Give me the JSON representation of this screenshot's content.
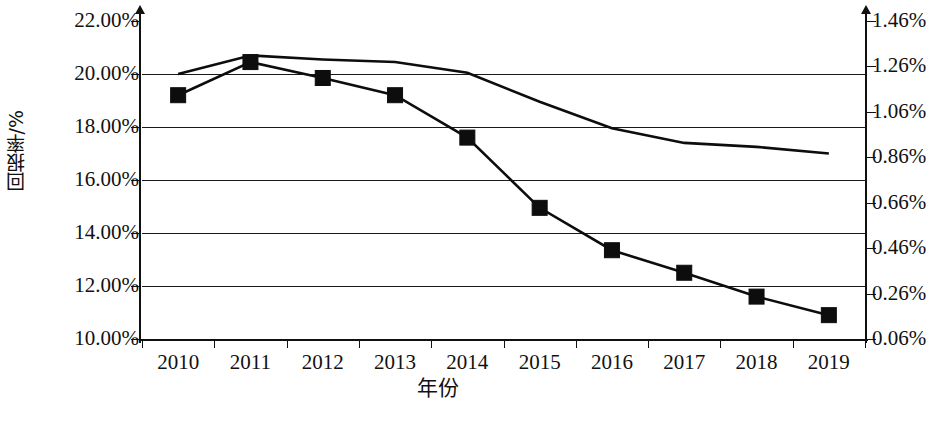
{
  "chart_data": {
    "type": "line",
    "title": "",
    "xlabel": "年份",
    "ylabel": "回报率/%",
    "ylabel_right": "",
    "categories": [
      "2010",
      "2011",
      "2012",
      "2013",
      "2014",
      "2015",
      "2016",
      "2017",
      "2018",
      "2019"
    ],
    "ylim": [
      10.0,
      22.0
    ],
    "yticks": [
      "10.00%",
      "12.00%",
      "14.00%",
      "16.00%",
      "18.00%",
      "20.00%",
      "22.00%"
    ],
    "ylim_right": [
      0.06,
      1.46
    ],
    "yticks_right": [
      "0.06%",
      "0.26%",
      "0.46%",
      "0.66%",
      "0.86%",
      "1.06%",
      "1.26%",
      "1.46%"
    ],
    "grid": true,
    "legend_position": "bottom",
    "series": [
      {
        "name": "ROE",
        "marker": "square",
        "axis": "left",
        "unit": "%",
        "values": [
          19.2,
          20.45,
          19.85,
          19.2,
          17.6,
          14.95,
          13.35,
          12.5,
          11.6,
          10.9
        ]
      },
      {
        "name": "ROA",
        "marker": "triangle",
        "axis": "right",
        "unit": "%",
        "values": [
          1.26,
          1.334,
          1.32,
          1.31,
          1.266,
          1.14,
          1.046,
          1.01,
          1.0,
          0.975
        ]
      }
    ],
    "series_plot_left_scale": {
      "ROE": [
        19.2,
        20.45,
        19.85,
        19.2,
        17.6,
        14.95,
        13.35,
        12.5,
        11.6,
        10.9
      ],
      "ROA": [
        20.0,
        20.7,
        20.55,
        20.45,
        20.05,
        18.95,
        17.95,
        17.4,
        17.25,
        17.0
      ]
    },
    "colors": {
      "line": "#0d0d0d",
      "marker": "#0d0d0d",
      "grid": "#1a1a1a",
      "background": "#ffffff"
    }
  },
  "legend": {
    "items": [
      {
        "label": "ROE",
        "marker": "square"
      },
      {
        "label": "ROA",
        "marker": "triangle"
      }
    ]
  }
}
